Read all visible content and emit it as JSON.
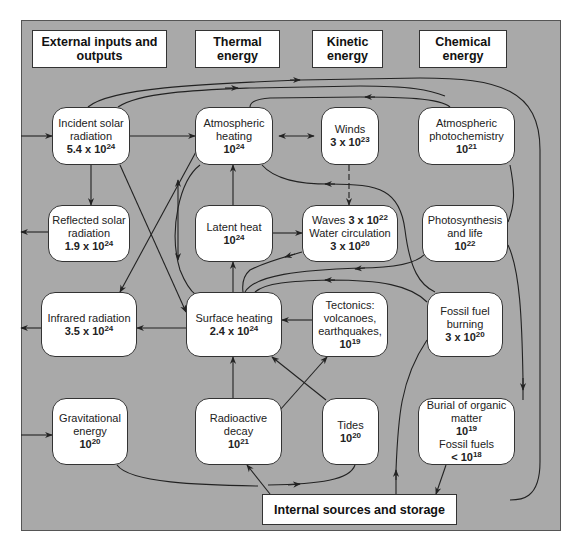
{
  "headers": {
    "external": "External inputs and outputs",
    "thermal": "Thermal energy",
    "kinetic": "Kinetic energy",
    "chemical": "Chemical energy"
  },
  "nodes": {
    "incident_solar": {
      "label": "Incident solar radiation",
      "base": "5.4 x 10",
      "exp": "24"
    },
    "atmos_heating": {
      "label": "Atmospheric heating",
      "base": "10",
      "exp": "24"
    },
    "winds": {
      "label": "Winds",
      "base": "3 x 10",
      "exp": "23"
    },
    "atmos_photochem": {
      "label": "Atmospheric photochemistry",
      "base": "10",
      "exp": "21"
    },
    "reflected_solar": {
      "label": "Reflected solar radiation",
      "base": "1.9 x 10",
      "exp": "24"
    },
    "latent_heat": {
      "label": "Latent heat",
      "base": "10",
      "exp": "24"
    },
    "waves": {
      "label": "Waves",
      "base": "3 x 10",
      "exp": "22",
      "label2": "Water circulation",
      "base2": "3 x 10",
      "exp2": "20"
    },
    "photosynthesis": {
      "label": "Photosynthesis and life",
      "base": "10",
      "exp": "22"
    },
    "infrared": {
      "label": "Infrared radiation",
      "base": "3.5 x 10",
      "exp": "24"
    },
    "surface_heating": {
      "label": "Surface heating",
      "base": "2.4 x 10",
      "exp": "24"
    },
    "tectonics": {
      "label": "Tectonics: volcanoes, earthquakes,",
      "base": "10",
      "exp": "19"
    },
    "fossil_burning": {
      "label": "Fossil fuel burning",
      "base": "3 x 10",
      "exp": "20"
    },
    "gravitational": {
      "label": "Gravitational energy",
      "base": "10",
      "exp": "20"
    },
    "radioactive": {
      "label": "Radioactive decay",
      "base": "10",
      "exp": "21"
    },
    "tides": {
      "label": "Tides",
      "base": "10",
      "exp": "20"
    },
    "burial": {
      "label": "Burial of organic matter",
      "base": "10",
      "exp": "19",
      "label2": "Fossil fuels",
      "base2": "< 10",
      "exp2": "18"
    }
  },
  "internal": "Internal sources and storage",
  "colors": {
    "panel": "#a9a9a9",
    "box": "#ffffff",
    "line": "#222222"
  }
}
